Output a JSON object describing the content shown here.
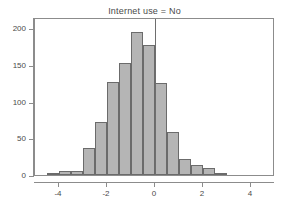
{
  "chart_data": {
    "type": "bar",
    "title": "Internet use = No",
    "xlabel": "",
    "ylabel": "",
    "grid": false,
    "legend": null,
    "xlim": [
      -5,
      5
    ],
    "ylim": [
      0,
      200
    ],
    "xticks": [
      "-4",
      "-2",
      "0",
      "2",
      "4"
    ],
    "xtick_values": [
      -4,
      -2,
      0,
      2,
      4
    ],
    "yticks": [
      "0",
      "50",
      "100",
      "150",
      "200"
    ],
    "ytick_values": [
      0,
      50,
      100,
      150,
      200
    ],
    "bin_width": 0.5,
    "annotations": [
      {
        "name": "zero-reference-line",
        "type": "vline",
        "x": 0
      }
    ],
    "bins": [
      {
        "x": -4.5,
        "value": 2
      },
      {
        "x": -4.0,
        "value": 5
      },
      {
        "x": -3.5,
        "value": 5
      },
      {
        "x": -3.0,
        "value": 37
      },
      {
        "x": -2.5,
        "value": 72
      },
      {
        "x": -2.0,
        "value": 126
      },
      {
        "x": -1.5,
        "value": 153
      },
      {
        "x": -1.0,
        "value": 195
      },
      {
        "x": -0.5,
        "value": 177
      },
      {
        "x": 0.0,
        "value": 125
      },
      {
        "x": 0.5,
        "value": 59
      },
      {
        "x": 1.0,
        "value": 22
      },
      {
        "x": 1.5,
        "value": 14
      },
      {
        "x": 2.0,
        "value": 9
      },
      {
        "x": 2.5,
        "value": 2
      }
    ],
    "categories": [
      -4.5,
      -4.0,
      -3.5,
      -3.0,
      -2.5,
      -2.0,
      -1.5,
      -1.0,
      -0.5,
      0.0,
      0.5,
      1.0,
      1.5,
      2.0,
      2.5
    ],
    "values": [
      2,
      5,
      5,
      37,
      72,
      126,
      153,
      195,
      177,
      125,
      59,
      22,
      14,
      9,
      2
    ]
  },
  "style": {
    "bar_fill": "#b5b5b5",
    "bar_stroke": "#6b6b6b",
    "axis_color": "#8c8c8c",
    "text_color": "#4a4a4a",
    "background": "#ffffff"
  }
}
